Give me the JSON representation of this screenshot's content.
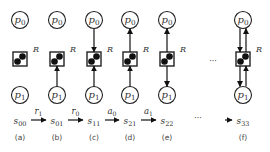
{
  "diagram": {
    "columns": [
      {
        "id": "a",
        "caption": "(a)",
        "x": 20,
        "state": "s",
        "state_sub": "00",
        "arrows": {
          "p1_to_R": false,
          "R_to_p0": false,
          "p0_to_R": false,
          "R_to_p1": false
        }
      },
      {
        "id": "b",
        "caption": "(b)",
        "x": 57,
        "state": "s",
        "state_sub": "01",
        "arrows": {
          "p1_to_R": true,
          "R_to_p0": false,
          "p0_to_R": false,
          "R_to_p1": false
        }
      },
      {
        "id": "c",
        "caption": "(c)",
        "x": 94,
        "state": "s",
        "state_sub": "11",
        "arrows": {
          "p1_to_R": true,
          "R_to_p0": false,
          "p0_to_R": true,
          "R_to_p1": false
        }
      },
      {
        "id": "d",
        "caption": "(d)",
        "x": 130,
        "state": "s",
        "state_sub": "21",
        "arrows": {
          "p1_to_R": true,
          "R_to_p0": true,
          "p0_to_R": false,
          "R_to_p1": false
        }
      },
      {
        "id": "e",
        "caption": "(e)",
        "x": 167,
        "state": "s",
        "state_sub": "22",
        "arrows": {
          "p1_to_R": false,
          "R_to_p0": true,
          "p0_to_R": false,
          "R_to_p1": true
        }
      },
      {
        "id": "f",
        "caption": "(f)",
        "x": 243,
        "state": "s",
        "state_sub": "33",
        "arrows": {
          "p1_to_R": true,
          "R_to_p0": true,
          "p0_to_R": true,
          "R_to_p1": true
        }
      }
    ],
    "process_top": {
      "label": "p",
      "sub": "0"
    },
    "process_bottom": {
      "label": "p",
      "sub": "1"
    },
    "resource_label": "R",
    "transitions": [
      {
        "from": "a",
        "to": "b",
        "label": "r",
        "sub": "1"
      },
      {
        "from": "b",
        "to": "c",
        "label": "r",
        "sub": "0"
      },
      {
        "from": "c",
        "to": "d",
        "label": "a",
        "sub": "0"
      },
      {
        "from": "d",
        "to": "e",
        "label": "a",
        "sub": "1"
      },
      {
        "from": "e",
        "to": "f",
        "label": "",
        "sub": ""
      }
    ],
    "ellipsis": "···",
    "colors": {
      "stroke": "#222222",
      "token": "#111111",
      "text": "#444444",
      "bg": "#ffffff"
    }
  }
}
